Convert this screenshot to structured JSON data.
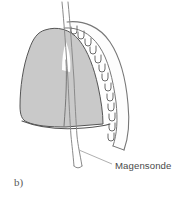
{
  "figure": {
    "panel_label": "b)",
    "caption_label": "Magensonde",
    "background_color": "#ffffff"
  },
  "anatomy": {
    "lung": {
      "name": "lung",
      "fill_color": "#c9c9c9",
      "outline_color": "#555555",
      "fissure_color": "#6e6e6e"
    },
    "ribcage": {
      "name": "rib-cage",
      "band_fill": "#fdfdfd",
      "outline_color": "#777777",
      "rib_count": 13,
      "rib_stroke": "#6a6a6a"
    },
    "tube": {
      "name": "nasogastric-tube",
      "stroke_color": "#8a8a8a",
      "label": "Magensonde"
    },
    "diaphragm": {
      "name": "diaphragm",
      "stroke_color": "#555555"
    }
  },
  "annotation": {
    "leader_line_color": "#9a9a9a",
    "text_color": "#4a4a4a"
  }
}
